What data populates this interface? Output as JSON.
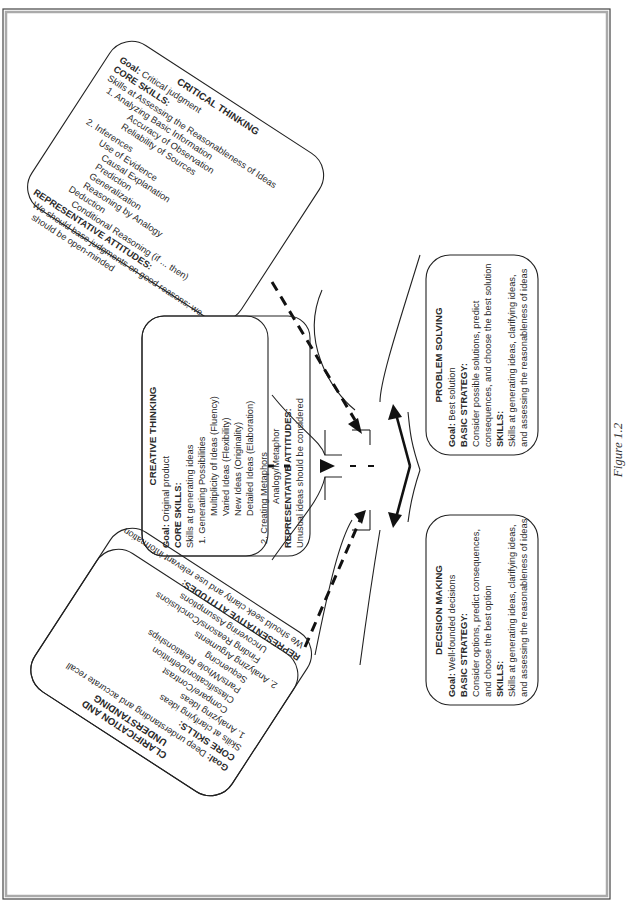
{
  "figure_caption": "Figure 1.2",
  "boxes": {
    "critical_thinking": {
      "title": "CRITICAL THINKING",
      "goal_label": "Goal:",
      "goal": "Critical judgment",
      "core_label": "CORE SKILLS:",
      "lines": [
        "Skills at Assessing the Reasonableness of Ideas",
        "1. Analyzing Basic Information",
        "Accuracy of Observation",
        "Reliability of Sources",
        "2. Inferences",
        "Use of Evidence",
        "Causal Explanation",
        "Prediction",
        "Generalization",
        "Reasoning by Analogy",
        "Deduction",
        "Conditional Reasoning (if ... then)"
      ],
      "attitudes_label": "REPRESENTATIVE ATTITUDES:",
      "attitudes": [
        "We should base judgments on good reasons; we",
        "should be open-minded"
      ]
    },
    "creative_thinking": {
      "title": "CREATIVE THINKING",
      "goal_label": "Goal:",
      "goal": "Original product",
      "core_label": "CORE SKILLS:",
      "lines": [
        "Skills at generating ideas",
        "1. Generating Possibilities",
        "Multiplicity of Ideas (Fluency)",
        "Varied Ideas (Flexibility)",
        "New Ideas (Originality)",
        "Detailed Ideas (Elaboration)",
        "2. Creating Metaphors",
        "Analogy/Metaphor"
      ],
      "attitudes_label": "REPRESENTATIVE ATTITUDES:",
      "attitudes": [
        "Unusual ideas should be considered"
      ]
    },
    "clarification": {
      "title_lines": [
        "CLARIFICATION AND",
        "UNDERSTANDING"
      ],
      "goal_label": "Goal:",
      "goal": "Deep understanding and accurate recall",
      "core_label": "CORE SKILLS:",
      "lines": [
        "Skills at clarifying ideas",
        "1. Analyzing Ideas",
        "Compare/Contrast",
        "Classification/Definition",
        "Parts/Whole Relationships",
        "Sequencing",
        "2. Analyzing Arguments",
        "Finding Reasons/Conclusions",
        "Uncovering Assumptions"
      ],
      "attitudes_label": "REPRESENTATIVE ATTITUDES:",
      "attitudes": [
        "We should seek clarity and use relevant information"
      ]
    },
    "decision_making": {
      "title": "DECISION MAKING",
      "goal_label": "Goal:",
      "goal": "Well-founded decisions",
      "strategy_label": "BASIC STRATEGY:",
      "strategy": [
        "Consider options, predict consequences,",
        "and choose the best option"
      ],
      "skills_label": "SKILLS:",
      "skills": [
        "Skills at generating ideas, clarifying ideas,",
        "and assessing the reasonableness of ideas"
      ]
    },
    "problem_solving": {
      "title": "PROBLEM SOLVING",
      "goal_label": "Goal:",
      "goal": "Best solution",
      "strategy_label": "BASIC STRATEGY:",
      "strategy": [
        "Consider possible solutions, predict",
        "consequences, and choose the best solution"
      ],
      "skills_label": "SKILLS:",
      "skills": [
        "Skills at generating ideas, clarifying ideas,",
        "and assessing the reasonableness of ideas"
      ]
    }
  }
}
